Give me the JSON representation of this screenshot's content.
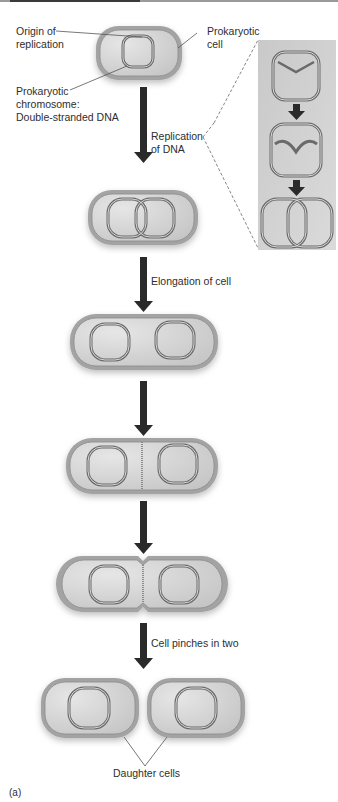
{
  "figure": {
    "panel_label": "(a)",
    "labels": {
      "origin_of_replication": [
        "Origin of",
        "replication"
      ],
      "prokaryotic_cell": [
        "Prokaryotic",
        "cell"
      ],
      "prokaryotic_chromosome": [
        "Prokaryotic",
        "chromosome:",
        "Double-stranded DNA"
      ],
      "replication_of_dna": [
        "Replication",
        "of DNA"
      ],
      "elongation_of_cell": "Elongation of cell",
      "cell_pinches_in_two": "Cell pinches in two",
      "daughter_cells": "Daughter cells"
    },
    "steps": [
      {
        "id": "step-1",
        "description": "Single cell with one circular chromosome"
      },
      {
        "id": "step-2",
        "description": "Chromosome replicated, two overlapping circles"
      },
      {
        "id": "step-3",
        "description": "Elongated cell with two separated chromosomes"
      },
      {
        "id": "step-4",
        "description": "Septum begins forming at middle"
      },
      {
        "id": "step-5",
        "description": "Cell constricts at middle"
      },
      {
        "id": "step-6",
        "description": "Two daughter cells"
      }
    ],
    "inset": {
      "description": "Detail of DNA replication",
      "stages": [
        "replication fork opens",
        "two strands copying",
        "two interlinked circles"
      ]
    },
    "colors": {
      "cell_wall": "#9c9c9c",
      "cytoplasm": "#cfcfcf",
      "arrow": "#2a2a2a",
      "inset_bg": "#cdcdcd",
      "text": "#2e2e2e"
    }
  }
}
